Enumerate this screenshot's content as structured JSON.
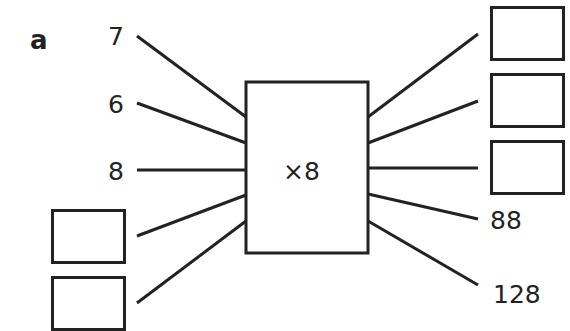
{
  "part_label": "a",
  "machine": {
    "operation": "×8"
  },
  "inputs": [
    {
      "value": "7",
      "blank": false
    },
    {
      "value": "6",
      "blank": false
    },
    {
      "value": "8",
      "blank": false
    },
    {
      "value": "",
      "blank": true
    },
    {
      "value": "",
      "blank": true
    }
  ],
  "outputs": [
    {
      "value": "",
      "blank": true
    },
    {
      "value": "",
      "blank": true
    },
    {
      "value": "",
      "blank": true
    },
    {
      "value": "88",
      "blank": false
    },
    {
      "value": "128",
      "blank": false
    }
  ],
  "colors": {
    "stroke": "#222222",
    "background": "#ffffff"
  }
}
